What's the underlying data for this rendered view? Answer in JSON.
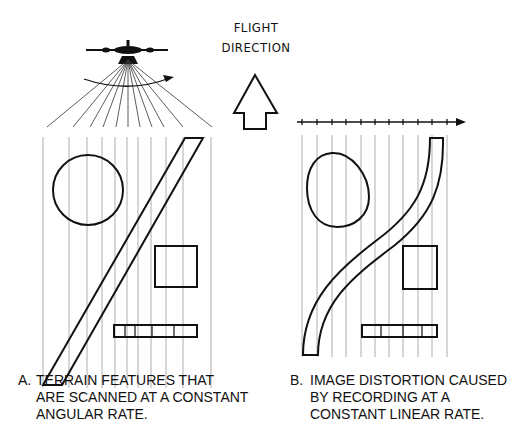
{
  "flight_label": {
    "line1": "FLIGHT",
    "line2": "DIRECTION"
  },
  "caption_a": {
    "letter": "A.",
    "lines": [
      "TERRAIN FEATURES THAT",
      "ARE SCANNED AT A  CONSTANT",
      "ANGULAR RATE."
    ]
  },
  "caption_b": {
    "letter": "B.",
    "lines": [
      "IMAGE DISTORTION CAUSED",
      "BY RECORDING AT A",
      "CONSTANT  LINEAR RATE."
    ]
  },
  "colors": {
    "ink": "#111111",
    "scan_line": "#9a9a9a"
  }
}
